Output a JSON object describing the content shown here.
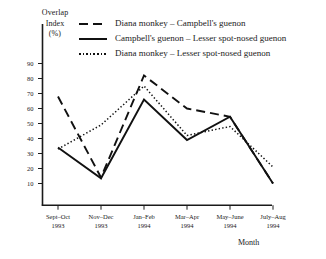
{
  "chart_data": {
    "type": "line",
    "title": "",
    "xlabel": "Month",
    "ylabel": "Overlap Index (%)",
    "ylabel_lines": [
      "Overlap",
      "Index",
      "(%)"
    ],
    "categories": [
      "Sept–Oct 1993",
      "Nov–Dec 1993",
      "Jan–Feb 1994",
      "Mar–Apr 1994",
      "May–June 1994",
      "July–Aug 1994"
    ],
    "category_lines": [
      [
        "Sept–Oct",
        "1993"
      ],
      [
        "Nov–Dec",
        "1993"
      ],
      [
        "Jan–Feb",
        "1994"
      ],
      [
        "Mar–Apr",
        "1994"
      ],
      [
        "May–June",
        "1994"
      ],
      [
        "July–Aug",
        "1994"
      ]
    ],
    "yticks": [
      90,
      80,
      70,
      60,
      50,
      40,
      30,
      20,
      10
    ],
    "ytick_labels": [
      "90",
      "80",
      "70",
      "60",
      "50",
      "40",
      "30",
      "20",
      "10"
    ],
    "ylim": [
      0,
      95
    ],
    "grid": false,
    "legend_position": "top-inside",
    "series": [
      {
        "name": "Diana monkey – Campbell's guenon",
        "style": "dashed",
        "color": "#111111",
        "values": [
          68,
          14,
          82,
          60,
          54.5,
          10
        ]
      },
      {
        "name": "Campbell's guenon – Lesser spot-nosed guenon",
        "style": "solid",
        "color": "#111111",
        "values": [
          34,
          13.5,
          66,
          39,
          54.5,
          10
        ]
      },
      {
        "name": "Diana monkey – Lesser spot-nosed guenon",
        "style": "dotted",
        "color": "#111111",
        "values": [
          33,
          49,
          75,
          42,
          48,
          21
        ]
      }
    ]
  },
  "legend": {
    "items": [
      {
        "label": "Diana monkey – Campbell's guenon",
        "style": "dashed"
      },
      {
        "label": "Campbell's guenon – Lesser spot-nosed guenon",
        "style": "solid"
      },
      {
        "label": "Diana monkey – Lesser spot-nosed guenon",
        "style": "dotted"
      }
    ]
  }
}
